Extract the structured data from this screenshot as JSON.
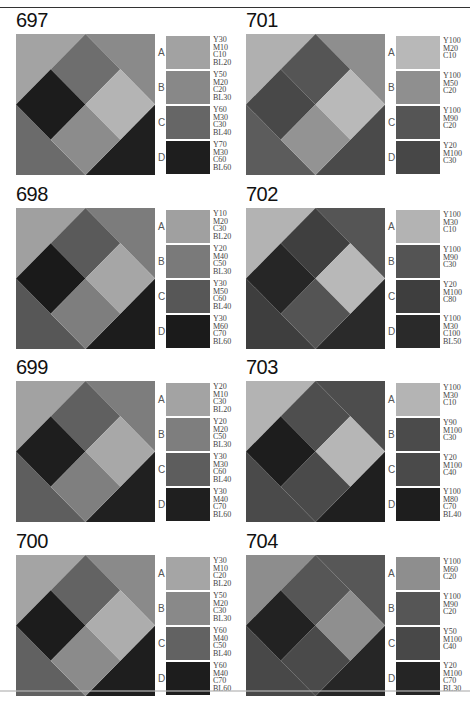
{
  "panels": [
    {
      "number": "697",
      "pattern": {
        "tl": "#a3a3a3",
        "tr": "#8a8a8a",
        "bl": "#6b6b6b",
        "br": "#1f1f1f",
        "dtop": "#6e6e6e",
        "dleft": "#1c1c1c",
        "dright": "#b4b4b4",
        "dbottom": "#8c8c8c"
      },
      "swatches": [
        {
          "label": "A",
          "color": "#a2a2a2",
          "spec": "Y30\nM10\nC10\nBL20"
        },
        {
          "label": "B",
          "color": "#888888",
          "spec": "Y50\nM20\nC20\nBL30"
        },
        {
          "label": "C",
          "color": "#666666",
          "spec": "Y60\nM30\nC30\nBL40"
        },
        {
          "label": "D",
          "color": "#1e1e1e",
          "spec": "Y70\nM30\nC60\nBL60"
        }
      ]
    },
    {
      "number": "701",
      "pattern": {
        "tl": "#b0b0b0",
        "tr": "#8e8e8e",
        "bl": "#5c5c5c",
        "br": "#4a4a4a",
        "dtop": "#555555",
        "dleft": "#484848",
        "dright": "#b9b9b9",
        "dbottom": "#939393"
      },
      "swatches": [
        {
          "label": "A",
          "color": "#b8b8b8",
          "spec": "Y100\nM20\nC10"
        },
        {
          "label": "B",
          "color": "#8f8f8f",
          "spec": "Y100\nM50\nC20"
        },
        {
          "label": "C",
          "color": "#555555",
          "spec": "Y100\nM90\nC20"
        },
        {
          "label": "D",
          "color": "#474747",
          "spec": "Y20\nM100\nC30"
        }
      ]
    },
    {
      "number": "698",
      "pattern": {
        "tl": "#a0a0a0",
        "tr": "#7c7c7c",
        "bl": "#575757",
        "br": "#1c1c1c",
        "dtop": "#5a5a5a",
        "dleft": "#1a1a1a",
        "dright": "#a6a6a6",
        "dbottom": "#7e7e7e"
      },
      "swatches": [
        {
          "label": "A",
          "color": "#a0a0a0",
          "spec": "Y10\nM20\nC30\nBL20"
        },
        {
          "label": "B",
          "color": "#7a7a7a",
          "spec": "Y20\nM40\nC50\nBL30"
        },
        {
          "label": "C",
          "color": "#575757",
          "spec": "Y30\nM50\nC60\nBL40"
        },
        {
          "label": "D",
          "color": "#1b1b1b",
          "spec": "Y30\nM60\nC70\nBL60"
        }
      ]
    },
    {
      "number": "702",
      "pattern": {
        "tl": "#b3b3b3",
        "tr": "#555555",
        "bl": "#3e3e3e",
        "br": "#2a2a2a",
        "dtop": "#3f3f3f",
        "dleft": "#262626",
        "dright": "#b8b8b8",
        "dbottom": "#545454"
      },
      "swatches": [
        {
          "label": "A",
          "color": "#b3b3b3",
          "spec": "Y100\nM30\nC10"
        },
        {
          "label": "B",
          "color": "#545454",
          "spec": "Y100\nM90\nC30"
        },
        {
          "label": "C",
          "color": "#3e3e3e",
          "spec": "Y20\nM100\nC80"
        },
        {
          "label": "D",
          "color": "#2a2a2a",
          "spec": "Y100\nM30\nC100\nBL50"
        }
      ]
    },
    {
      "number": "699",
      "pattern": {
        "tl": "#a2a2a2",
        "tr": "#7d7d7d",
        "bl": "#5e5e5e",
        "br": "#202020",
        "dtop": "#606060",
        "dleft": "#1e1e1e",
        "dright": "#a8a8a8",
        "dbottom": "#7f7f7f"
      },
      "swatches": [
        {
          "label": "A",
          "color": "#a3a3a3",
          "spec": "Y20\nM10\nC30\nBL20"
        },
        {
          "label": "B",
          "color": "#7e7e7e",
          "spec": "Y20\nM20\nC50\nBL30"
        },
        {
          "label": "C",
          "color": "#5d5d5d",
          "spec": "Y30\nM30\nC60\nBL40"
        },
        {
          "label": "D",
          "color": "#1f1f1f",
          "spec": "Y30\nM40\nC70\nBL60"
        }
      ]
    },
    {
      "number": "703",
      "pattern": {
        "tl": "#b3b3b3",
        "tr": "#4d4d4d",
        "bl": "#4a4a4a",
        "br": "#1f1f1f",
        "dtop": "#4e4e4e",
        "dleft": "#1d1d1d",
        "dright": "#b6b6b6",
        "dbottom": "#4a4a4a"
      },
      "swatches": [
        {
          "label": "A",
          "color": "#b4b4b4",
          "spec": "Y100\nM30\nC10"
        },
        {
          "label": "B",
          "color": "#4b4b4b",
          "spec": "Y90\nM100\nC30"
        },
        {
          "label": "C",
          "color": "#4a4a4a",
          "spec": "Y20\nM100\nC40"
        },
        {
          "label": "D",
          "color": "#1e1e1e",
          "spec": "Y100\nM80\nC70\nBL40"
        }
      ]
    },
    {
      "number": "700",
      "pattern": {
        "tl": "#a4a4a4",
        "tr": "#8a8a8a",
        "bl": "#616161",
        "br": "#1e1e1e",
        "dtop": "#636363",
        "dleft": "#1c1c1c",
        "dright": "#adadad",
        "dbottom": "#8b8b8b"
      },
      "swatches": [
        {
          "label": "A",
          "color": "#a5a5a5",
          "spec": "Y30\nM10\nC20\nBL20"
        },
        {
          "label": "B",
          "color": "#898989",
          "spec": "Y50\nM20\nC30\nBL30"
        },
        {
          "label": "C",
          "color": "#626262",
          "spec": "Y60\nM40\nC50\nBL40"
        },
        {
          "label": "D",
          "color": "#1d1d1d",
          "spec": "Y60\nM40\nC70\nBL60"
        }
      ]
    },
    {
      "number": "704",
      "pattern": {
        "tl": "#8d8d8d",
        "tr": "#575757",
        "bl": "#484848",
        "br": "#262626",
        "dtop": "#565656",
        "dleft": "#222222",
        "dright": "#8f8f8f",
        "dbottom": "#4a4a4a"
      },
      "swatches": [
        {
          "label": "A",
          "color": "#8e8e8e",
          "spec": "Y100\nM60\nC20"
        },
        {
          "label": "B",
          "color": "#565656",
          "spec": "Y100\nM90\nC20"
        },
        {
          "label": "C",
          "color": "#484848",
          "spec": "Y50\nM100\nC40"
        },
        {
          "label": "D",
          "color": "#252525",
          "spec": "Y20\nM100\nC70\nBL30"
        }
      ]
    }
  ]
}
